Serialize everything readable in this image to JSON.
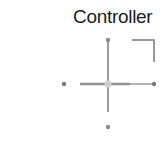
{
  "widget": {
    "title": "Controller",
    "icon": "dpad-joystick-icon",
    "colors": {
      "line_dark": "#8a8a8a",
      "line_light": "#b4b4b4",
      "dot": "#7a7a7a",
      "center": "#d0d0d0",
      "title": "#1c1c1c"
    }
  }
}
